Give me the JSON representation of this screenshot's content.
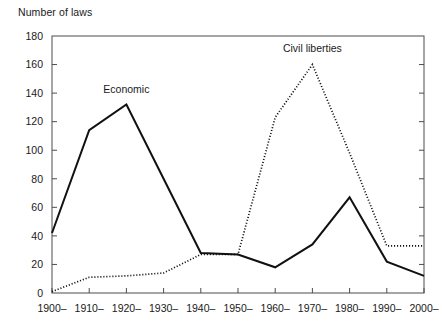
{
  "chart_data": {
    "type": "line",
    "title": "",
    "xlabel": "",
    "ylabel": "Number of laws",
    "ylim": [
      0,
      180
    ],
    "ytick_step": 20,
    "grid": false,
    "legend": "inline-annotations",
    "categories": [
      "1900–",
      "1910–",
      "1920–",
      "1930–",
      "1940–",
      "1950–",
      "1960–",
      "1970–",
      "1980–",
      "1990–",
      "2000–"
    ],
    "yticks": [
      "0",
      "20",
      "40",
      "60",
      "80",
      "100",
      "120",
      "140",
      "160",
      "180"
    ],
    "series": [
      {
        "name": "Economic",
        "style": "solid",
        "color": "#111111",
        "values": [
          42,
          114,
          132,
          80,
          28,
          27,
          18,
          34,
          67,
          22,
          12
        ]
      },
      {
        "name": "Civil liberties",
        "style": "dotted",
        "color": "#111111",
        "values": [
          1,
          11,
          12,
          14,
          27,
          27,
          123,
          160,
          98,
          33,
          33
        ]
      }
    ],
    "annotations": [
      {
        "text": "Economic",
        "category": "1920–",
        "value": 140
      },
      {
        "text": "Civil liberties",
        "category": "1970–",
        "value": 169
      }
    ]
  },
  "axis": {
    "y_axis_title": "Number of laws"
  }
}
